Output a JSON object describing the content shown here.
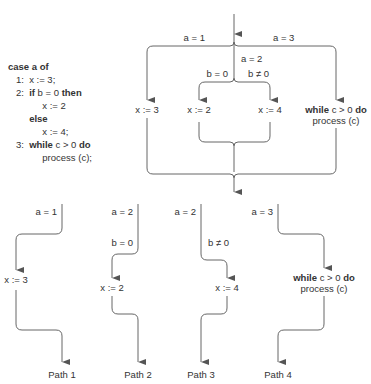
{
  "code_listing": {
    "header": "case a of",
    "lines": [
      {
        "num": "1:",
        "text": "x := 3;"
      },
      {
        "num": "2:",
        "kw": "if",
        "text": " b = 0 ",
        "kw2": "then"
      },
      {
        "indent": "x := 2"
      },
      {
        "kw_else": "else"
      },
      {
        "indent": "x := 4;"
      },
      {
        "num": "3:",
        "kw": "while",
        "text": " c > 0 ",
        "kw2": "do"
      },
      {
        "indent": "process (c);"
      }
    ]
  },
  "flow": {
    "labels": {
      "a1": "a = 1",
      "a2": "a = 2",
      "a3": "a = 3",
      "b0": "b = 0",
      "bne0": "b ≠ 0",
      "x3": "x := 3",
      "x2": "x := 2",
      "x4": "x := 4",
      "while_kw": "while",
      "while_cond": " c > 0 ",
      "do_kw": "do",
      "process": "process (c)"
    }
  },
  "paths": [
    {
      "name": "Path 1",
      "guards": [
        "a = 1"
      ],
      "stmt": "x := 3"
    },
    {
      "name": "Path 2",
      "guards": [
        "a = 2",
        "b = 0"
      ],
      "stmt": "x := 2"
    },
    {
      "name": "Path 3",
      "guards": [
        "a = 2",
        "b ≠ 0"
      ],
      "stmt": "x := 4"
    },
    {
      "name": "Path 4",
      "guards": [
        "a = 3"
      ],
      "stmt": "while c > 0 do process (c)"
    }
  ]
}
